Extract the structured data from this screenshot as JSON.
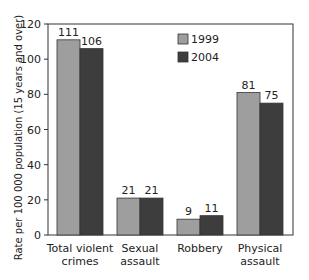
{
  "chart_data": {
    "type": "bar",
    "title": "",
    "xlabel": "",
    "ylabel": "Rate per 100 000 population (15 years and over)",
    "ylim": [
      0,
      120
    ],
    "yticks": [
      0,
      20,
      40,
      60,
      80,
      100,
      120
    ],
    "grid": false,
    "legend_position": "upper center",
    "categories": [
      [
        "Total violent",
        "crimes"
      ],
      [
        "Sexual",
        "assault"
      ],
      [
        "Robbery"
      ],
      [
        "Physical",
        "assault"
      ]
    ],
    "series": [
      {
        "name": "1999",
        "color": "#9e9e9e",
        "values": [
          111,
          21,
          9,
          81
        ]
      },
      {
        "name": "2004",
        "color": "#3d3d3d",
        "values": [
          106,
          21,
          11,
          75
        ]
      }
    ]
  }
}
